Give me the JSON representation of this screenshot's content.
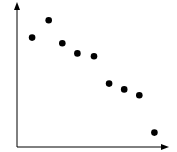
{
  "chart_data": {
    "type": "scatter",
    "title": "",
    "xlabel": "",
    "ylabel": "",
    "xlim": [
      0,
      10
    ],
    "ylim": [
      0,
      10
    ],
    "grid": false,
    "legend": null,
    "axes_style": "arrowed axes, no ticks or tick labels",
    "series": [
      {
        "name": "points",
        "color": "#000000",
        "x": [
          1.0,
          2.1,
          3.0,
          4.0,
          5.1,
          6.1,
          7.1,
          8.1,
          9.1
        ],
        "y": [
          7.6,
          8.8,
          7.2,
          6.5,
          6.3,
          4.4,
          4.0,
          3.6,
          1.0
        ]
      }
    ]
  },
  "colors": {
    "axis": "#000000",
    "marker": "#000000",
    "background": "#ffffff"
  }
}
